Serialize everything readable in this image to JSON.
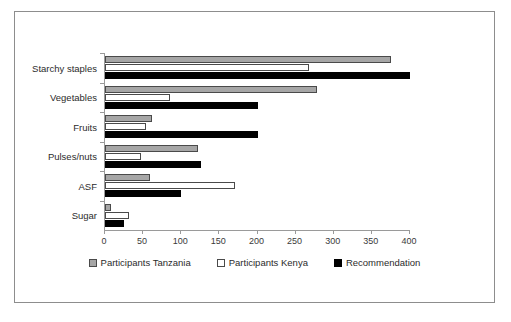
{
  "chart_data": {
    "type": "bar",
    "orientation": "horizontal",
    "title": "",
    "xlabel": "",
    "ylabel": "",
    "xlim": [
      0,
      400
    ],
    "xticks": [
      0,
      50,
      100,
      150,
      200,
      250,
      300,
      350,
      400
    ],
    "grid": false,
    "legend_position": "bottom",
    "categories": [
      "Starchy staples",
      "Vegetables",
      "Fruits",
      "Pulses/nuts",
      "ASF",
      "Sugar"
    ],
    "series": [
      {
        "name": "Participants Tanzania",
        "color": "#a6a6a6",
        "values": [
          375,
          278,
          61,
          122,
          59,
          8
        ]
      },
      {
        "name": "Participants Kenya",
        "color": "#ffffff",
        "values": [
          268,
          85,
          54,
          47,
          170,
          32
        ]
      },
      {
        "name": "Recommendation",
        "color": "#000000",
        "values": [
          400,
          200,
          200,
          126,
          100,
          25
        ]
      }
    ]
  },
  "axis": {
    "tick_labels": [
      "0",
      "50",
      "100",
      "150",
      "200",
      "250",
      "300",
      "350",
      "400"
    ]
  },
  "legend": {
    "items": [
      {
        "label": "Participants Tanzania",
        "swatch": "tanzania"
      },
      {
        "label": "Participants Kenya",
        "swatch": "kenya"
      },
      {
        "label": "Recommendation",
        "swatch": "recommendation"
      }
    ]
  },
  "colors": {
    "tanzania": "#a6a6a6",
    "kenya": "#ffffff",
    "recommendation": "#000000",
    "axis": "#9a9a9a",
    "frame": "#8d8d8d"
  }
}
